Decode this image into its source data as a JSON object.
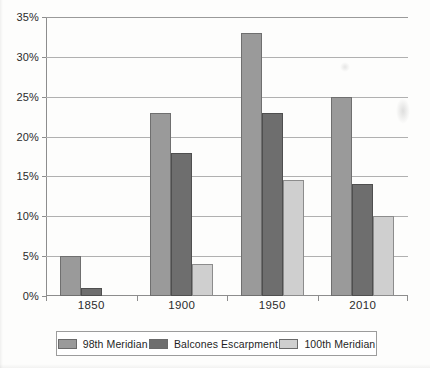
{
  "chart_data": {
    "type": "bar",
    "title": "",
    "xlabel": "",
    "ylabel": "",
    "categories": [
      "1850",
      "1900",
      "1950",
      "2010"
    ],
    "series": [
      {
        "name": "98th Meridian",
        "color": "#9a9a9a",
        "values": [
          5,
          23,
          33,
          25
        ]
      },
      {
        "name": "Balcones Escarpment",
        "color": "#6e6e6e",
        "values": [
          1,
          18,
          23,
          14
        ]
      },
      {
        "name": "100th Meridian",
        "color": "#cfcfcf",
        "values": [
          0.1,
          4,
          14.5,
          10
        ]
      }
    ],
    "ylim": [
      0,
      35
    ],
    "ytick_values": [
      0,
      5,
      10,
      15,
      20,
      25,
      30,
      35
    ],
    "ytick_labels": [
      "0%",
      "5%",
      "10%",
      "15%",
      "20%",
      "25%",
      "30%",
      "35%"
    ],
    "grid": true,
    "legend_position": "bottom"
  }
}
